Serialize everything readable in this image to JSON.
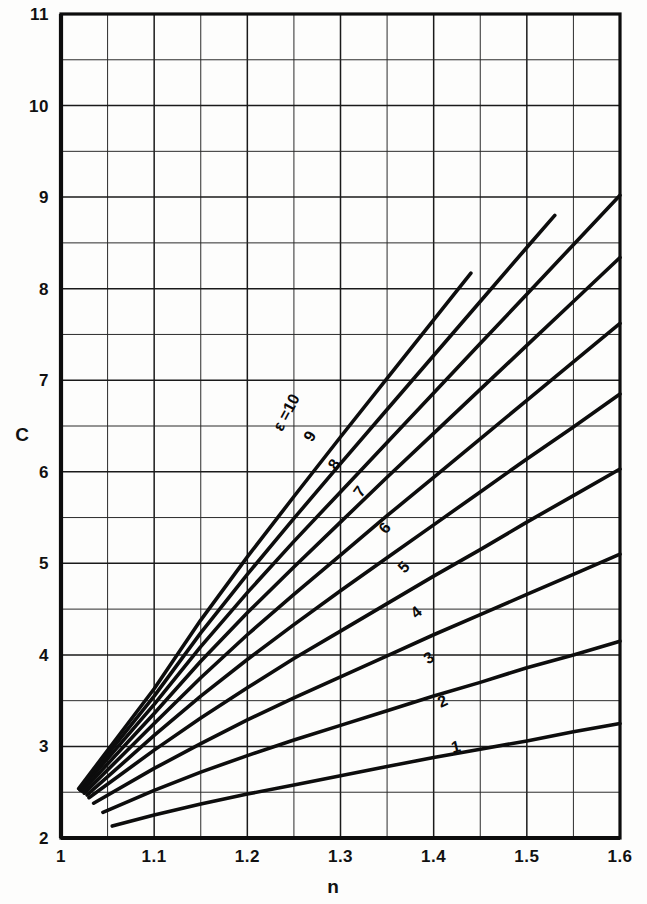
{
  "figure": {
    "background_color": "#fdfdfc",
    "ink_color": "#0d0d0d"
  },
  "axes": {
    "x_title": "n",
    "y_title": "C",
    "x_ticks": [
      "1",
      "1.1",
      "1.2",
      "1.3",
      "1.4",
      "1.5",
      "1.6"
    ],
    "y_ticks": [
      "2",
      "3",
      "4",
      "5",
      "6",
      "7",
      "8",
      "9",
      "10",
      "11"
    ]
  },
  "chart_data": {
    "type": "line",
    "title": "",
    "xlabel": "n",
    "ylabel": "C",
    "xlim": [
      1.0,
      1.6
    ],
    "ylim": [
      2.0,
      11.0
    ],
    "x_major_step": 0.1,
    "x_minor_step": 0.05,
    "y_major_step": 1.0,
    "y_minor_step": 0.5,
    "grid": true,
    "legend_position": "inline-curve-labels",
    "parameter_symbol": "ε",
    "first_label_text": "ε =10",
    "series": [
      {
        "name": "1",
        "label": "1",
        "epsilon": 1,
        "x": [
          1.055,
          1.1,
          1.15,
          1.2,
          1.25,
          1.3,
          1.35,
          1.4,
          1.45,
          1.5,
          1.55,
          1.6
        ],
        "values": [
          2.13,
          2.25,
          2.37,
          2.48,
          2.58,
          2.68,
          2.78,
          2.88,
          2.97,
          3.06,
          3.16,
          3.25
        ]
      },
      {
        "name": "2",
        "label": "2",
        "epsilon": 2,
        "x": [
          1.045,
          1.1,
          1.15,
          1.2,
          1.25,
          1.3,
          1.35,
          1.4,
          1.45,
          1.5,
          1.55,
          1.6
        ],
        "values": [
          2.28,
          2.52,
          2.72,
          2.9,
          3.07,
          3.23,
          3.39,
          3.55,
          3.7,
          3.86,
          4.0,
          4.15
        ]
      },
      {
        "name": "3",
        "label": "3",
        "epsilon": 3,
        "x": [
          1.035,
          1.1,
          1.15,
          1.2,
          1.25,
          1.3,
          1.35,
          1.4,
          1.45,
          1.5,
          1.55,
          1.6
        ],
        "values": [
          2.38,
          2.76,
          3.03,
          3.29,
          3.53,
          3.76,
          3.99,
          4.22,
          4.44,
          4.66,
          4.88,
          5.1
        ]
      },
      {
        "name": "4",
        "label": "4",
        "epsilon": 4,
        "x": [
          1.03,
          1.1,
          1.15,
          1.2,
          1.25,
          1.3,
          1.35,
          1.4,
          1.45,
          1.5,
          1.55,
          1.6
        ],
        "values": [
          2.44,
          2.96,
          3.31,
          3.64,
          3.96,
          4.26,
          4.56,
          4.86,
          5.15,
          5.45,
          5.74,
          6.03
        ]
      },
      {
        "name": "5",
        "label": "5",
        "epsilon": 5,
        "x": [
          1.028,
          1.1,
          1.15,
          1.2,
          1.25,
          1.3,
          1.35,
          1.4,
          1.45,
          1.5,
          1.55,
          1.6
        ],
        "values": [
          2.47,
          3.12,
          3.55,
          3.95,
          4.33,
          4.7,
          5.06,
          5.42,
          5.78,
          6.14,
          6.49,
          6.85
        ]
      },
      {
        "name": "6",
        "label": "6",
        "epsilon": 6,
        "x": [
          1.025,
          1.1,
          1.15,
          1.2,
          1.25,
          1.3,
          1.35,
          1.4,
          1.45,
          1.5,
          1.55,
          1.6
        ],
        "values": [
          2.49,
          3.25,
          3.75,
          4.22,
          4.66,
          5.09,
          5.52,
          5.94,
          6.36,
          6.78,
          7.2,
          7.62
        ]
      },
      {
        "name": "7",
        "label": "7",
        "epsilon": 7,
        "x": [
          1.023,
          1.1,
          1.15,
          1.2,
          1.25,
          1.3,
          1.35,
          1.4,
          1.45,
          1.5,
          1.55,
          1.6
        ],
        "values": [
          2.51,
          3.36,
          3.93,
          4.46,
          4.96,
          5.45,
          5.94,
          6.42,
          6.9,
          7.38,
          7.86,
          8.34
        ]
      },
      {
        "name": "8",
        "label": "8",
        "epsilon": 8,
        "x": [
          1.021,
          1.1,
          1.15,
          1.2,
          1.25,
          1.3,
          1.35,
          1.4,
          1.45,
          1.5,
          1.55,
          1.6
        ],
        "values": [
          2.52,
          3.46,
          4.09,
          4.68,
          5.24,
          5.78,
          6.32,
          6.86,
          7.4,
          7.94,
          8.48,
          9.02
        ]
      },
      {
        "name": "9",
        "label": "9",
        "epsilon": 9,
        "x": [
          1.02,
          1.1,
          1.15,
          1.2,
          1.25,
          1.3,
          1.35,
          1.4,
          1.45,
          1.5,
          1.53
        ],
        "values": [
          2.53,
          3.55,
          4.24,
          4.88,
          5.49,
          6.09,
          6.68,
          7.27,
          7.86,
          8.45,
          8.8
        ]
      },
      {
        "name": "10",
        "label": "ε =10",
        "epsilon": 10,
        "x": [
          1.019,
          1.1,
          1.15,
          1.2,
          1.25,
          1.3,
          1.35,
          1.4,
          1.44
        ],
        "values": [
          2.54,
          3.63,
          4.38,
          5.07,
          5.73,
          6.38,
          7.02,
          7.66,
          8.17
        ]
      }
    ],
    "curve_label_positions": [
      {
        "series": "10",
        "n": 1.247,
        "c": 6.62,
        "rotation": -62
      },
      {
        "series": "9",
        "n": 1.272,
        "c": 6.36,
        "rotation": -60
      },
      {
        "series": "8",
        "n": 1.298,
        "c": 6.05,
        "rotation": -57
      },
      {
        "series": "7",
        "n": 1.325,
        "c": 5.75,
        "rotation": -54
      },
      {
        "series": "6",
        "n": 1.352,
        "c": 5.35,
        "rotation": -50
      },
      {
        "series": "5",
        "n": 1.372,
        "c": 4.92,
        "rotation": -46
      },
      {
        "series": "4",
        "n": 1.385,
        "c": 4.42,
        "rotation": -40
      },
      {
        "series": "3",
        "n": 1.398,
        "c": 3.92,
        "rotation": -33
      },
      {
        "series": "2",
        "n": 1.412,
        "c": 3.44,
        "rotation": -25
      },
      {
        "series": "1",
        "n": 1.425,
        "c": 2.94,
        "rotation": -14
      }
    ]
  }
}
